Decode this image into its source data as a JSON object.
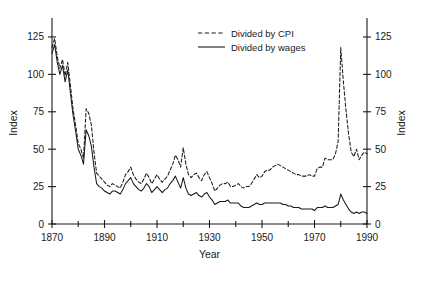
{
  "chart_data": {
    "type": "line",
    "title": "",
    "xlabel": "Year",
    "ylabel": "Index",
    "ylabel_right": "Index",
    "xlim": [
      1870,
      1990
    ],
    "ylim": [
      0,
      135
    ],
    "xticks": [
      1870,
      1890,
      1910,
      1930,
      1950,
      1970,
      1990
    ],
    "xtick_labels": [
      "1870",
      "1890",
      "1910",
      "1930",
      "1950",
      "1970",
      "1990"
    ],
    "xminor_step": 10,
    "yticks": [
      0,
      25,
      50,
      75,
      100,
      125
    ],
    "ytick_labels": [
      "0",
      "25",
      "50",
      "75",
      "100",
      "125"
    ],
    "grid": false,
    "legend_position": "top-center",
    "series": [
      {
        "name": "Divided by CPI",
        "style": "dashed",
        "color": "#1a1a1a",
        "x": [
          1870,
          1871,
          1872,
          1873,
          1874,
          1875,
          1876,
          1877,
          1878,
          1879,
          1880,
          1881,
          1882,
          1883,
          1884,
          1885,
          1886,
          1887,
          1888,
          1889,
          1890,
          1891,
          1892,
          1893,
          1894,
          1895,
          1896,
          1897,
          1898,
          1899,
          1900,
          1901,
          1902,
          1903,
          1904,
          1905,
          1906,
          1907,
          1908,
          1909,
          1910,
          1911,
          1912,
          1913,
          1914,
          1915,
          1916,
          1917,
          1918,
          1919,
          1920,
          1921,
          1922,
          1923,
          1924,
          1925,
          1926,
          1927,
          1928,
          1929,
          1930,
          1931,
          1932,
          1933,
          1934,
          1935,
          1936,
          1937,
          1938,
          1939,
          1940,
          1941,
          1942,
          1943,
          1944,
          1945,
          1946,
          1947,
          1948,
          1949,
          1950,
          1951,
          1952,
          1953,
          1954,
          1955,
          1956,
          1957,
          1958,
          1959,
          1960,
          1961,
          1962,
          1963,
          1964,
          1965,
          1966,
          1967,
          1968,
          1969,
          1970,
          1971,
          1972,
          1973,
          1974,
          1975,
          1976,
          1977,
          1978,
          1979,
          1980,
          1981,
          1982,
          1983,
          1984,
          1985,
          1986,
          1987,
          1988,
          1989,
          1990
        ],
        "values": [
          118,
          124,
          112,
          104,
          110,
          99,
          108,
          93,
          77,
          66,
          54,
          50,
          44,
          77,
          74,
          66,
          48,
          34,
          32,
          30,
          28,
          26,
          25,
          27,
          26,
          25,
          24,
          28,
          33,
          35,
          38,
          33,
          30,
          28,
          27,
          30,
          34,
          31,
          27,
          30,
          33,
          30,
          28,
          30,
          32,
          36,
          40,
          46,
          43,
          38,
          51,
          40,
          33,
          31,
          33,
          34,
          31,
          29,
          33,
          35,
          31,
          27,
          22,
          24,
          26,
          27,
          27,
          28,
          25,
          25,
          26,
          27,
          25,
          24,
          25,
          25,
          27,
          30,
          33,
          31,
          32,
          35,
          36,
          36,
          38,
          39,
          40,
          39,
          38,
          37,
          36,
          35,
          34,
          33,
          33,
          32,
          32,
          32,
          33,
          32,
          32,
          37,
          38,
          38,
          44,
          43,
          43,
          43,
          47,
          55,
          118,
          95,
          76,
          60,
          48,
          45,
          50,
          43,
          46,
          48,
          47
        ]
      },
      {
        "name": "Divided by wages",
        "style": "solid",
        "color": "#1a1a1a",
        "x": [
          1870,
          1871,
          1872,
          1873,
          1874,
          1875,
          1876,
          1877,
          1878,
          1879,
          1880,
          1881,
          1882,
          1883,
          1884,
          1885,
          1886,
          1887,
          1888,
          1889,
          1890,
          1891,
          1892,
          1893,
          1894,
          1895,
          1896,
          1897,
          1898,
          1899,
          1900,
          1901,
          1902,
          1903,
          1904,
          1905,
          1906,
          1907,
          1908,
          1909,
          1910,
          1911,
          1912,
          1913,
          1914,
          1915,
          1916,
          1917,
          1918,
          1919,
          1920,
          1921,
          1922,
          1923,
          1924,
          1925,
          1926,
          1927,
          1928,
          1929,
          1930,
          1931,
          1932,
          1933,
          1934,
          1935,
          1936,
          1937,
          1938,
          1939,
          1940,
          1941,
          1942,
          1943,
          1944,
          1945,
          1946,
          1947,
          1948,
          1949,
          1950,
          1951,
          1952,
          1953,
          1954,
          1955,
          1956,
          1957,
          1958,
          1959,
          1960,
          1961,
          1962,
          1963,
          1964,
          1965,
          1966,
          1967,
          1968,
          1969,
          1970,
          1971,
          1972,
          1973,
          1974,
          1975,
          1976,
          1977,
          1978,
          1979,
          1980,
          1981,
          1982,
          1983,
          1984,
          1985,
          1986,
          1987,
          1988,
          1989,
          1990
        ],
        "values": [
          114,
          120,
          108,
          100,
          106,
          95,
          103,
          88,
          73,
          62,
          50,
          46,
          40,
          63,
          59,
          52,
          38,
          27,
          25,
          24,
          22,
          21,
          20,
          22,
          22,
          21,
          20,
          23,
          27,
          29,
          31,
          27,
          25,
          23,
          22,
          24,
          27,
          25,
          21,
          23,
          25,
          23,
          21,
          23,
          24,
          27,
          29,
          32,
          28,
          24,
          31,
          24,
          20,
          19,
          20,
          21,
          19,
          18,
          20,
          21,
          18,
          16,
          13,
          14,
          15,
          15,
          15,
          16,
          14,
          14,
          14,
          14,
          12,
          11,
          11,
          11,
          12,
          13,
          14,
          13,
          13,
          14,
          14,
          14,
          14,
          14,
          14,
          14,
          13,
          13,
          12,
          12,
          11,
          11,
          11,
          10,
          10,
          10,
          10,
          10,
          9,
          11,
          11,
          11,
          12,
          11,
          11,
          11,
          12,
          13,
          20,
          16,
          13,
          10,
          8,
          7,
          8,
          7,
          8,
          8,
          7
        ]
      }
    ],
    "legend": [
      {
        "label": "Divided by CPI",
        "style": "dashed"
      },
      {
        "label": "Divided by wages",
        "style": "solid"
      }
    ]
  }
}
